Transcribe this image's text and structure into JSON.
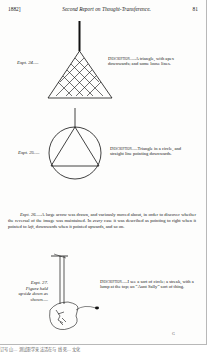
{
  "header": {
    "year": "1882]",
    "title": "Second Report on Thought-Transference.",
    "page_number": "81"
  },
  "experiments": [
    {
      "label": "Expt. 24.—",
      "description_head": "Description",
      "description_text": ".—A triangle, with apex downwards; and some loose lines."
    },
    {
      "label": "Expt. 25.—",
      "description_head": "Description",
      "description_text": ".—Triangle in a circle, and straight line pointing downwards."
    },
    {
      "label": "Expt. 27. Figure held upside down as shown.—",
      "description_head": "Description",
      "description_text": ".—I see a sort of circle; a streak, with a lump at the top; an “Aunt Sally” sort of thing."
    }
  ],
  "paragraph": {
    "label": "Expt. 26.",
    "text_1": "—A large arrow was drawn, and variously moved about, in order to discover whether the reversal of the image was maintained. In ",
    "emph_1": "every",
    "text_2": " case it was described as pointing to right when it pointed to ",
    "emph_2": "left",
    "text_3": ", downwards when it pointed upwards, and so on."
  },
  "signature_mark": "G",
  "footer": "订号 山… 测试影学来 法活在与 线 死… 文化"
}
